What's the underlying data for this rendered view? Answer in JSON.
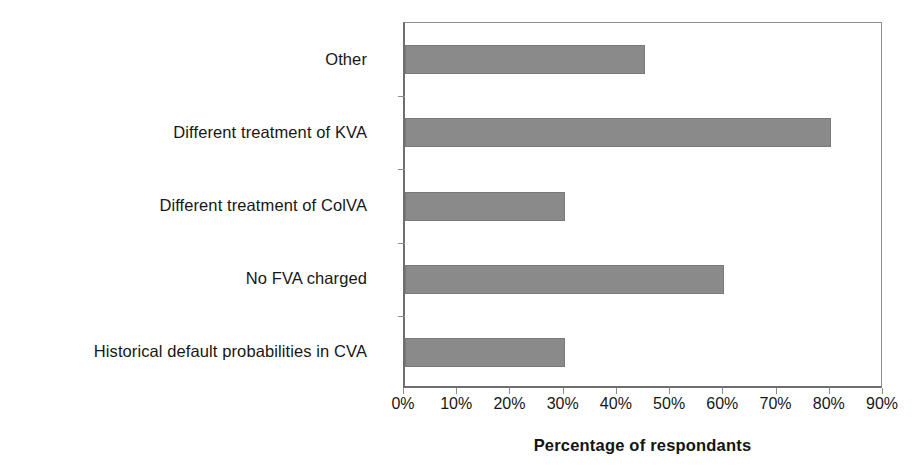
{
  "chart_data": {
    "type": "bar",
    "orientation": "horizontal",
    "title": "",
    "subtitle": "",
    "xlabel": "Percentage of respondants",
    "ylabel": "",
    "categories": [
      "Other",
      "Different treatment of KVA",
      "Different treatment of ColVA",
      "No FVA charged",
      "Historical default probabilities in CVA"
    ],
    "values": [
      45,
      80,
      30,
      60,
      30
    ],
    "value_unit": "%",
    "xlim": [
      0,
      90
    ],
    "xticks": [
      0,
      10,
      20,
      30,
      40,
      50,
      60,
      70,
      80,
      90
    ],
    "xtick_labels": [
      "0%",
      "10%",
      "20%",
      "30%",
      "40%",
      "50%",
      "60%",
      "70%",
      "80%",
      "90%"
    ],
    "grid": false,
    "legend": null,
    "legend_position": "none",
    "annotations": [],
    "colors": {
      "bar_fill": "#8a8a8a",
      "bar_edge": "#7a7a7a",
      "axis_line": "#6e6e6e",
      "tick_line": "#8d8d8d",
      "text": "#171717",
      "background": "#ffffff"
    }
  }
}
